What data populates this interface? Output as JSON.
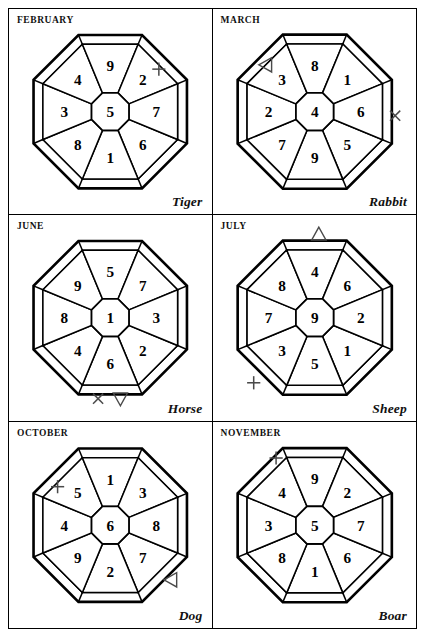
{
  "page": {
    "columns": 2,
    "rows": 3
  },
  "glyphs": {
    "plus": "+",
    "cross": "×",
    "triangle_up": "△",
    "triangle_down": "▽",
    "triangle_left": "◁"
  },
  "directions": [
    "N",
    "NE",
    "E",
    "SE",
    "S",
    "SW",
    "W",
    "NW"
  ],
  "panels": [
    {
      "id": "february",
      "month": "FEBRUARY",
      "animal": "Tiger",
      "center": "5",
      "sectors": {
        "N": "9",
        "NE": "2",
        "E": "7",
        "SE": "6",
        "S": "1",
        "SW": "8",
        "W": "3",
        "NW": "4"
      },
      "markers": [
        {
          "symbol": "+",
          "name": "plus-marker",
          "position": "NE",
          "x": 148,
          "y": 58
        }
      ]
    },
    {
      "id": "march",
      "month": "MARCH",
      "animal": "Rabbit",
      "center": "4",
      "sectors": {
        "N": "8",
        "NE": "1",
        "E": "6",
        "SE": "5",
        "S": "9",
        "SW": "7",
        "W": "2",
        "NW": "3"
      },
      "markers": [
        {
          "symbol": "◁",
          "name": "triangle-left-marker",
          "position": "NW",
          "x": 52,
          "y": 54
        },
        {
          "symbol": "×",
          "name": "cross-marker",
          "position": "E",
          "x": 179,
          "y": 104
        }
      ]
    },
    {
      "id": "june",
      "month": "JUNE",
      "animal": "Horse",
      "center": "1",
      "sectors": {
        "N": "5",
        "NE": "7",
        "E": "3",
        "SE": "2",
        "S": "6",
        "SW": "4",
        "W": "8",
        "NW": "9"
      },
      "markers": [
        {
          "symbol": "×",
          "name": "cross-marker",
          "position": "S-left",
          "x": 88,
          "y": 180
        },
        {
          "symbol": "▽",
          "name": "triangle-down-marker",
          "position": "S",
          "x": 110,
          "y": 180
        }
      ]
    },
    {
      "id": "july",
      "month": "JULY",
      "animal": "Sheep",
      "center": "9",
      "sectors": {
        "N": "4",
        "NE": "6",
        "E": "2",
        "SE": "1",
        "S": "5",
        "SW": "3",
        "W": "7",
        "NW": "8"
      },
      "markers": [
        {
          "symbol": "△",
          "name": "triangle-up-marker",
          "position": "N",
          "x": 104,
          "y": 18
        },
        {
          "symbol": "+",
          "name": "plus-marker",
          "position": "SW",
          "x": 40,
          "y": 164
        }
      ]
    },
    {
      "id": "october",
      "month": "OCTOBER",
      "animal": "Dog",
      "center": "6",
      "sectors": {
        "N": "1",
        "NE": "3",
        "E": "8",
        "SE": "7",
        "S": "2",
        "SW": "9",
        "W": "4",
        "NW": "5"
      },
      "markers": [
        {
          "symbol": "+",
          "name": "plus-marker",
          "position": "NW",
          "x": 48,
          "y": 62
        },
        {
          "symbol": "◁",
          "name": "triangle-left-marker",
          "position": "SE",
          "x": 160,
          "y": 154
        }
      ]
    },
    {
      "id": "november",
      "month": "NOVEMBER",
      "animal": "Boar",
      "center": "5",
      "sectors": {
        "N": "9",
        "NE": "2",
        "E": "7",
        "SE": "6",
        "S": "1",
        "SW": "8",
        "W": "3",
        "NW": "4"
      },
      "markers": [
        {
          "symbol": "+",
          "name": "plus-marker",
          "position": "NW",
          "x": 62,
          "y": 34
        }
      ]
    }
  ]
}
